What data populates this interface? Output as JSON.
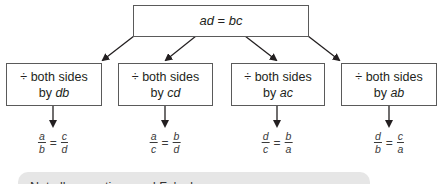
{
  "diagram": {
    "top": {
      "equation": "ad = bc",
      "lhs": "ad",
      "op": "=",
      "rhs": "bc"
    },
    "steps": [
      {
        "line1": "÷ both sides",
        "by": "by ",
        "divisor": "db",
        "result": {
          "num1": "a",
          "den1": "b",
          "eq": "=",
          "num2": "c",
          "den2": "d"
        }
      },
      {
        "line1": "÷ both sides",
        "by": "by ",
        "divisor": "cd",
        "result": {
          "num1": "a",
          "den1": "c",
          "eq": "=",
          "num2": "b",
          "den2": "d"
        }
      },
      {
        "line1": "÷ both sides",
        "by": "by ",
        "divisor": "ac",
        "result": {
          "num1": "d",
          "den1": "c",
          "eq": "=",
          "num2": "b",
          "den2": "a"
        }
      },
      {
        "line1": "÷ both sides",
        "by": "by ",
        "divisor": "ab",
        "result": {
          "num1": "d",
          "den1": "b",
          "eq": "=",
          "num2": "c",
          "den2": "a"
        }
      }
    ],
    "note": {
      "text": "Not all proportions and Fo's d"
    },
    "colors": {
      "box_border": "#5a5a5a",
      "arrow": "#231f20",
      "note_bg": "#e6e6e6"
    }
  }
}
